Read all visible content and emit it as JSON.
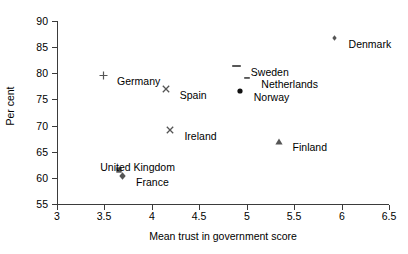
{
  "chart_data": {
    "type": "scatter",
    "title": "",
    "xlabel": "Mean trust in government score",
    "ylabel": "Per cent",
    "xlim": [
      3,
      6.5
    ],
    "ylim": [
      55,
      90
    ],
    "xticks": [
      "3",
      "3.5",
      "4",
      "4.5",
      "5",
      "5.5",
      "6",
      "6.5"
    ],
    "yticks": [
      "55",
      "60",
      "65",
      "70",
      "75",
      "80",
      "85",
      "90"
    ],
    "grid": false,
    "legend": "none",
    "points": [
      {
        "name": "Denmark",
        "x": 6.0,
        "y": 85.5,
        "marker": "diamond-small",
        "label_pos": "right"
      },
      {
        "name": "Germany",
        "x": 3.56,
        "y": 78.3,
        "marker": "plus",
        "label_pos": "right"
      },
      {
        "name": "Spain",
        "x": 4.22,
        "y": 75.7,
        "marker": "cross",
        "label_pos": "right"
      },
      {
        "name": "Ireland",
        "x": 4.27,
        "y": 67.8,
        "marker": "cross",
        "label_pos": "right"
      },
      {
        "name": "Finland",
        "x": 5.41,
        "y": 65.7,
        "marker": "triangle",
        "label_pos": "right"
      },
      {
        "name": "United Kingdom",
        "x": 3.73,
        "y": 60.2,
        "marker": "square",
        "label_pos": "above"
      },
      {
        "name": "France",
        "x": 3.76,
        "y": 59.0,
        "marker": "diamond",
        "label_pos": "right"
      },
      {
        "name": "Sweden",
        "x": 4.97,
        "y": 80.1,
        "marker": "dash-long",
        "label_pos": "right"
      },
      {
        "name": "Netherlands",
        "x": 5.08,
        "y": 77.8,
        "marker": "dash-short",
        "label_pos": "right"
      },
      {
        "name": "Norway",
        "x": 5.0,
        "y": 75.3,
        "marker": "circle",
        "label_pos": "right"
      }
    ]
  },
  "colors": {
    "axis": "#3b3b3b",
    "marker": "#555555",
    "text": "#000000",
    "background": "#ffffff"
  }
}
